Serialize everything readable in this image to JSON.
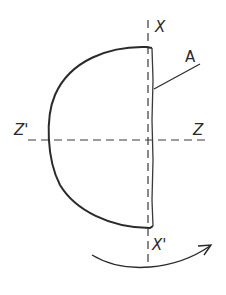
{
  "diagram": {
    "type": "half-disc rotation sketch",
    "labels": {
      "x_top": "X",
      "x_bottom": "X'",
      "z_left": "Z'",
      "z_right": "Z",
      "edge": "A"
    },
    "elements": {
      "shape": "semicircular plate (flat edge on axis X-X')",
      "vertical_axis": "X-X' dashed line",
      "horizontal_axis": "Z'-Z dashed line",
      "leader": "line from label A to flat edge",
      "rotation": "curved arrow below, clockwise toward right"
    },
    "colors": {
      "ink": "#2a2a2a",
      "background": "#ffffff"
    }
  }
}
